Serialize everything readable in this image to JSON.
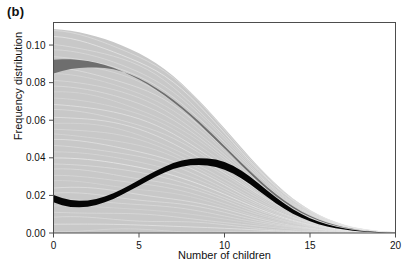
{
  "figure": {
    "panel_label": "(b)",
    "background": "#ffffff"
  },
  "chart_data": {
    "type": "area",
    "title": "",
    "subtitle": "",
    "xlabel": "Number of children",
    "ylabel": "Frequency distribution",
    "xlim": [
      0,
      20
    ],
    "ylim": [
      0,
      0.112
    ],
    "xticks": [
      0,
      5,
      10,
      15,
      20
    ],
    "xticklabels": [
      "0",
      "5",
      "10",
      "15",
      "20"
    ],
    "yticks": [
      0.0,
      0.02,
      0.04,
      0.06,
      0.08,
      0.1
    ],
    "yticklabels": [
      "0.00",
      "0.02",
      "0.04",
      "0.06",
      "0.08",
      "0.10"
    ],
    "grid": false,
    "legend": null,
    "annotations": [],
    "colors": {
      "light_gray_band": "#c8c8c8",
      "dark_gray_band": "#6e6e6e",
      "black_band": "#050505",
      "sample_curve": "#e9e9e9",
      "axis": "#4d4d4d",
      "text": "#111111"
    },
    "x": [
      0,
      0.5,
      1,
      1.5,
      2,
      2.5,
      3,
      3.5,
      4,
      4.5,
      5,
      5.5,
      6,
      6.5,
      7,
      7.5,
      8,
      8.5,
      9,
      9.5,
      10,
      10.5,
      11,
      11.5,
      12,
      12.5,
      13,
      13.5,
      14,
      14.5,
      15,
      15.5,
      16,
      16.5,
      17,
      17.5,
      18,
      18.5,
      19,
      19.5,
      20
    ],
    "series": [
      {
        "name": "light gray envelope upper",
        "role": "band_upper",
        "color": "#c8c8c8",
        "values": [
          0.1085,
          0.1082,
          0.1076,
          0.1068,
          0.1058,
          0.1046,
          0.1032,
          0.1016,
          0.0998,
          0.0978,
          0.0956,
          0.0931,
          0.0903,
          0.0871,
          0.0835,
          0.0795,
          0.0752,
          0.0706,
          0.0658,
          0.0608,
          0.0557,
          0.0505,
          0.0453,
          0.0402,
          0.0353,
          0.0306,
          0.0262,
          0.0221,
          0.0184,
          0.0151,
          0.0122,
          0.0097,
          0.0076,
          0.0058,
          0.0043,
          0.0031,
          0.0022,
          0.0015,
          0.0009,
          0.0005,
          0.0002
        ]
      },
      {
        "name": "light gray envelope lower",
        "role": "band_lower",
        "color": "#c8c8c8",
        "values": [
          0,
          0,
          0,
          0,
          0,
          0,
          0,
          0,
          0,
          0,
          0,
          0,
          0,
          0,
          0,
          0,
          0,
          0,
          0,
          0,
          0,
          0,
          0,
          0,
          0,
          0,
          0,
          0,
          0,
          0,
          0,
          0,
          0,
          0,
          0,
          0,
          0,
          0,
          0,
          0,
          0
        ]
      },
      {
        "name": "dark gray band upper",
        "role": "band_upper",
        "color": "#6e6e6e",
        "values": [
          0.0922,
          0.0924,
          0.0924,
          0.0921,
          0.0915,
          0.0906,
          0.0894,
          0.0879,
          0.0861,
          0.084,
          0.0817,
          0.0791,
          0.0762,
          0.0731,
          0.0697,
          0.0661,
          0.0622,
          0.0581,
          0.0538,
          0.0494,
          0.0449,
          0.0404,
          0.0359,
          0.0315,
          0.0273,
          0.0233,
          0.0196,
          0.0163,
          0.0133,
          0.0107,
          0.0085,
          0.0066,
          0.0051,
          0.0038,
          0.0028,
          0.002,
          0.0014,
          0.0009,
          0.0006,
          0.0003,
          0.0001
        ]
      },
      {
        "name": "dark gray band lower",
        "role": "band_lower",
        "color": "#6e6e6e",
        "values": [
          0.0848,
          0.0862,
          0.0872,
          0.0878,
          0.0881,
          0.0881,
          0.0878,
          0.0871,
          0.0859,
          0.0843,
          0.0823,
          0.0799,
          0.0772,
          0.0742,
          0.0709,
          0.0673,
          0.0635,
          0.0594,
          0.0552,
          0.0508,
          0.0463,
          0.0418,
          0.0373,
          0.0329,
          0.0286,
          0.0245,
          0.0207,
          0.0173,
          0.0142,
          0.0115,
          0.0092,
          0.0072,
          0.0056,
          0.0042,
          0.0031,
          0.0022,
          0.0015,
          0.001,
          0.0006,
          0.0003,
          0.0001
        ]
      },
      {
        "name": "black median band upper",
        "role": "band_upper",
        "color": "#050505",
        "values": [
          0.0202,
          0.0186,
          0.0175,
          0.0171,
          0.0173,
          0.0181,
          0.0194,
          0.0212,
          0.0233,
          0.0257,
          0.0282,
          0.0307,
          0.0331,
          0.0353,
          0.0372,
          0.0386,
          0.0394,
          0.0398,
          0.0397,
          0.0391,
          0.0378,
          0.0358,
          0.0331,
          0.0299,
          0.0263,
          0.0226,
          0.019,
          0.0157,
          0.0127,
          0.0101,
          0.0079,
          0.0061,
          0.0046,
          0.0034,
          0.0025,
          0.0017,
          0.0012,
          0.0008,
          0.0005,
          0.0002,
          0.0001
        ]
      },
      {
        "name": "black median band lower",
        "role": "band_lower",
        "color": "#050505",
        "values": [
          0.0163,
          0.0148,
          0.0139,
          0.0137,
          0.014,
          0.0149,
          0.0163,
          0.0181,
          0.0203,
          0.0227,
          0.0252,
          0.0277,
          0.0301,
          0.0322,
          0.034,
          0.0353,
          0.036,
          0.0362,
          0.0359,
          0.0351,
          0.0337,
          0.0316,
          0.029,
          0.0259,
          0.0225,
          0.0191,
          0.0158,
          0.0129,
          0.0103,
          0.0081,
          0.0062,
          0.0047,
          0.0035,
          0.0025,
          0.0018,
          0.0012,
          0.0008,
          0.0005,
          0.0003,
          0.0001,
          0.0
        ]
      }
    ],
    "sample_curves_note": "many thin pale sample curves drawn within the light gray envelope"
  }
}
